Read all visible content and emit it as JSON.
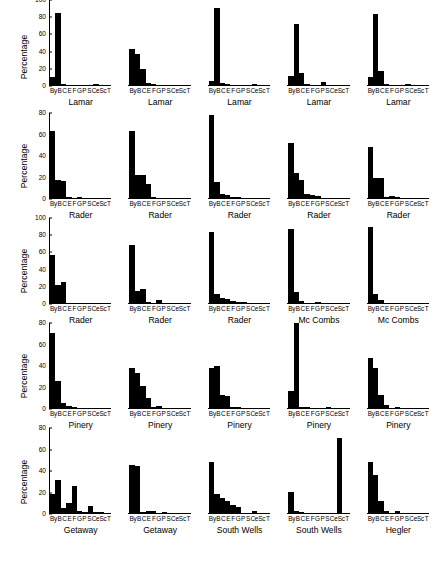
{
  "figure": {
    "y_axis_label": "Percentage",
    "x_categories": [
      "By",
      "B",
      "C",
      "E",
      "F",
      "G",
      "P",
      "S",
      "Ce",
      "Sc",
      "T"
    ],
    "x_tick_text": "ByB C E F G PSCeScT"
  },
  "chart_data": [
    {
      "type": "bar",
      "title": "Lamar",
      "ylabel": "Percentage",
      "xlabel": "",
      "ylim": [
        0,
        100
      ],
      "yticks": [
        0,
        20,
        40,
        60,
        80,
        100
      ],
      "grid": false,
      "categories": [
        "By",
        "B",
        "C",
        "E",
        "F",
        "G",
        "P",
        "S",
        "Ce",
        "Sc",
        "T"
      ],
      "values": [
        10,
        85,
        1,
        0,
        0,
        0,
        0,
        0,
        1,
        0,
        0
      ]
    },
    {
      "type": "bar",
      "title": "Lamar",
      "ylabel": "Percentage",
      "xlabel": "",
      "ylim": [
        0,
        100
      ],
      "yticks": [
        0,
        20,
        40,
        60,
        80,
        100
      ],
      "grid": false,
      "categories": [
        "By",
        "B",
        "C",
        "E",
        "F",
        "G",
        "P",
        "S",
        "Ce",
        "Sc",
        "T"
      ],
      "values": [
        42,
        37,
        19,
        2,
        1,
        0,
        0,
        0,
        0,
        0,
        0
      ]
    },
    {
      "type": "bar",
      "title": "Lamar",
      "ylabel": "Percentage",
      "xlabel": "",
      "ylim": [
        0,
        100
      ],
      "yticks": [
        0,
        20,
        40,
        60,
        80,
        100
      ],
      "grid": false,
      "categories": [
        "By",
        "B",
        "C",
        "E",
        "F",
        "G",
        "P",
        "S",
        "Ce",
        "Sc",
        "T"
      ],
      "values": [
        5,
        91,
        2,
        1,
        0,
        0,
        0,
        0,
        1,
        0,
        0
      ]
    },
    {
      "type": "bar",
      "title": "Lamar",
      "ylabel": "Percentage",
      "xlabel": "",
      "ylim": [
        0,
        100
      ],
      "yticks": [
        0,
        20,
        40,
        60,
        80,
        100
      ],
      "grid": false,
      "categories": [
        "By",
        "B",
        "C",
        "E",
        "F",
        "G",
        "P",
        "S",
        "Ce",
        "Sc",
        "T"
      ],
      "values": [
        11,
        72,
        14,
        1,
        0,
        0,
        3,
        0,
        0,
        0,
        0
      ]
    },
    {
      "type": "bar",
      "title": "Lamar",
      "ylabel": "Percentage",
      "xlabel": "",
      "ylim": [
        0,
        100
      ],
      "yticks": [
        0,
        20,
        40,
        60,
        80,
        100
      ],
      "grid": false,
      "categories": [
        "By",
        "B",
        "C",
        "E",
        "F",
        "G",
        "P",
        "S",
        "Ce",
        "Sc",
        "T"
      ],
      "values": [
        9,
        84,
        17,
        1,
        0,
        0,
        0,
        1,
        0,
        0,
        0
      ]
    },
    {
      "type": "bar",
      "title": "Rader",
      "ylabel": "Percentage",
      "xlabel": "",
      "ylim": [
        0,
        80
      ],
      "yticks": [
        0,
        20,
        40,
        60,
        80
      ],
      "grid": false,
      "categories": [
        "By",
        "B",
        "C",
        "E",
        "F",
        "G",
        "P",
        "S",
        "Ce",
        "Sc",
        "T"
      ],
      "values": [
        63,
        17,
        16,
        1,
        0,
        1,
        0,
        0,
        0,
        0,
        0
      ]
    },
    {
      "type": "bar",
      "title": "Rader",
      "ylabel": "Percentage",
      "xlabel": "",
      "ylim": [
        0,
        80
      ],
      "yticks": [
        0,
        20,
        40,
        60,
        80
      ],
      "grid": false,
      "categories": [
        "By",
        "B",
        "C",
        "E",
        "F",
        "G",
        "P",
        "S",
        "Ce",
        "Sc",
        "T"
      ],
      "values": [
        63,
        22,
        22,
        13,
        1,
        0,
        0,
        0,
        0,
        0,
        0
      ]
    },
    {
      "type": "bar",
      "title": "Rader",
      "ylabel": "Percentage",
      "xlabel": "",
      "ylim": [
        0,
        80
      ],
      "yticks": [
        0,
        20,
        40,
        60,
        80
      ],
      "grid": false,
      "categories": [
        "By",
        "B",
        "C",
        "E",
        "F",
        "G",
        "P",
        "S",
        "Ce",
        "Sc",
        "T"
      ],
      "values": [
        78,
        15,
        4,
        3,
        1,
        1,
        0,
        0,
        0,
        0,
        0
      ]
    },
    {
      "type": "bar",
      "title": "Rader",
      "ylabel": "Percentage",
      "xlabel": "",
      "ylim": [
        0,
        80
      ],
      "yticks": [
        0,
        20,
        40,
        60,
        80
      ],
      "grid": false,
      "categories": [
        "By",
        "B",
        "C",
        "E",
        "F",
        "G",
        "P",
        "S",
        "Ce",
        "Sc",
        "T"
      ],
      "values": [
        52,
        24,
        17,
        4,
        3,
        2,
        0,
        0,
        0,
        0,
        0
      ]
    },
    {
      "type": "bar",
      "title": "Rader",
      "ylabel": "Percentage",
      "xlabel": "",
      "ylim": [
        0,
        80
      ],
      "yticks": [
        0,
        20,
        40,
        60,
        80
      ],
      "grid": false,
      "categories": [
        "By",
        "B",
        "C",
        "E",
        "F",
        "G",
        "P",
        "S",
        "Ce",
        "Sc",
        "T"
      ],
      "values": [
        48,
        19,
        19,
        1,
        2,
        1,
        0,
        0,
        0,
        0,
        0
      ]
    },
    {
      "type": "bar",
      "title": "Rader",
      "ylabel": "Percentage",
      "xlabel": "",
      "ylim": [
        0,
        100
      ],
      "yticks": [
        0,
        20,
        40,
        60,
        80,
        100
      ],
      "grid": false,
      "categories": [
        "By",
        "B",
        "C",
        "E",
        "F",
        "G",
        "P",
        "S",
        "Ce",
        "Sc",
        "T"
      ],
      "values": [
        56,
        21,
        25,
        0,
        0,
        0,
        0,
        0,
        0,
        0,
        0
      ]
    },
    {
      "type": "bar",
      "title": "Rader",
      "ylabel": "Percentage",
      "xlabel": "",
      "ylim": [
        0,
        100
      ],
      "yticks": [
        0,
        20,
        40,
        60,
        80,
        100
      ],
      "grid": false,
      "categories": [
        "By",
        "B",
        "C",
        "E",
        "F",
        "G",
        "P",
        "S",
        "Ce",
        "Sc",
        "T"
      ],
      "values": [
        68,
        14,
        17,
        1,
        0,
        3,
        0,
        0,
        0,
        0,
        0
      ]
    },
    {
      "type": "bar",
      "title": "Rader",
      "ylabel": "Percentage",
      "xlabel": "",
      "ylim": [
        0,
        100
      ],
      "yticks": [
        0,
        20,
        40,
        60,
        80,
        100
      ],
      "grid": false,
      "categories": [
        "By",
        "B",
        "C",
        "E",
        "F",
        "G",
        "P",
        "S",
        "Ce",
        "Sc",
        "T"
      ],
      "values": [
        83,
        11,
        6,
        5,
        2,
        1,
        1,
        0,
        0,
        0,
        0
      ]
    },
    {
      "type": "bar",
      "title": "Mc Combs",
      "ylabel": "Percentage",
      "xlabel": "",
      "ylim": [
        0,
        100
      ],
      "yticks": [
        0,
        20,
        40,
        60,
        80,
        100
      ],
      "grid": false,
      "categories": [
        "By",
        "B",
        "C",
        "E",
        "F",
        "G",
        "P",
        "S",
        "Ce",
        "Sc",
        "T"
      ],
      "values": [
        87,
        13,
        2,
        0,
        0,
        1,
        0,
        0,
        0,
        0,
        0
      ]
    },
    {
      "type": "bar",
      "title": "Mc Combs",
      "ylabel": "Percentage",
      "xlabel": "",
      "ylim": [
        0,
        100
      ],
      "yticks": [
        0,
        20,
        40,
        60,
        80,
        100
      ],
      "grid": false,
      "categories": [
        "By",
        "B",
        "C",
        "E",
        "F",
        "G",
        "P",
        "S",
        "Ce",
        "Sc",
        "T"
      ],
      "values": [
        89,
        11,
        3,
        0,
        0,
        0,
        0,
        0,
        0,
        0,
        0
      ]
    },
    {
      "type": "bar",
      "title": "Pinery",
      "ylabel": "Percentage",
      "xlabel": "",
      "ylim": [
        0,
        80
      ],
      "yticks": [
        0,
        20,
        40,
        60,
        80
      ],
      "grid": false,
      "categories": [
        "By",
        "B",
        "C",
        "E",
        "F",
        "G",
        "P",
        "S",
        "Ce",
        "Sc",
        "T"
      ],
      "values": [
        71,
        25,
        5,
        2,
        1,
        0,
        0,
        0,
        0,
        0,
        0
      ]
    },
    {
      "type": "bar",
      "title": "Pinery",
      "ylabel": "Percentage",
      "xlabel": "",
      "ylim": [
        0,
        80
      ],
      "yticks": [
        0,
        20,
        40,
        60,
        80
      ],
      "grid": false,
      "categories": [
        "By",
        "B",
        "C",
        "E",
        "F",
        "G",
        "P",
        "S",
        "Ce",
        "Sc",
        "T"
      ],
      "values": [
        38,
        33,
        21,
        9,
        1,
        2,
        0,
        0,
        0,
        0,
        0
      ]
    },
    {
      "type": "bar",
      "title": "Pinery",
      "ylabel": "Percentage",
      "xlabel": "",
      "ylim": [
        0,
        80
      ],
      "yticks": [
        0,
        20,
        40,
        60,
        80
      ],
      "grid": false,
      "categories": [
        "By",
        "B",
        "C",
        "E",
        "F",
        "G",
        "P",
        "S",
        "Ce",
        "Sc",
        "T"
      ],
      "values": [
        38,
        40,
        12,
        11,
        1,
        1,
        0,
        0,
        0,
        0,
        0
      ]
    },
    {
      "type": "bar",
      "title": "Pinery",
      "ylabel": "Percentage",
      "xlabel": "",
      "ylim": [
        0,
        80
      ],
      "yticks": [
        0,
        20,
        40,
        60,
        80
      ],
      "grid": false,
      "categories": [
        "By",
        "B",
        "C",
        "E",
        "F",
        "G",
        "P",
        "S",
        "Ce",
        "Sc",
        "T"
      ],
      "values": [
        16,
        80,
        1,
        1,
        0,
        0,
        0,
        1,
        0,
        0,
        0
      ]
    },
    {
      "type": "bar",
      "title": "Pinery",
      "ylabel": "Percentage",
      "xlabel": "",
      "ylim": [
        0,
        80
      ],
      "yticks": [
        0,
        20,
        40,
        60,
        80
      ],
      "grid": false,
      "categories": [
        "By",
        "B",
        "C",
        "E",
        "F",
        "G",
        "P",
        "S",
        "Ce",
        "Sc",
        "T"
      ],
      "values": [
        47,
        38,
        12,
        3,
        0,
        1,
        0,
        0,
        0,
        0,
        0
      ]
    },
    {
      "type": "bar",
      "title": "Getaway",
      "ylabel": "Percentage",
      "xlabel": "",
      "ylim": [
        0,
        80
      ],
      "yticks": [
        0,
        20,
        40,
        60,
        80
      ],
      "grid": false,
      "categories": [
        "By",
        "B",
        "C",
        "E",
        "F",
        "G",
        "P",
        "S",
        "Ce",
        "Sc",
        "T"
      ],
      "values": [
        18,
        31,
        5,
        9,
        25,
        2,
        1,
        7,
        1,
        1,
        0
      ]
    },
    {
      "type": "bar",
      "title": "Getaway",
      "ylabel": "Percentage",
      "xlabel": "",
      "ylim": [
        0,
        80
      ],
      "yticks": [
        0,
        20,
        40,
        60,
        80
      ],
      "grid": false,
      "categories": [
        "By",
        "B",
        "C",
        "E",
        "F",
        "G",
        "P",
        "S",
        "Ce",
        "Sc",
        "T"
      ],
      "values": [
        45,
        44,
        1,
        2,
        2,
        0,
        1,
        0,
        0,
        0,
        0
      ]
    },
    {
      "type": "bar",
      "title": "South Wells",
      "ylabel": "Percentage",
      "xlabel": "",
      "ylim": [
        0,
        80
      ],
      "yticks": [
        0,
        20,
        40,
        60,
        80
      ],
      "grid": false,
      "categories": [
        "By",
        "B",
        "C",
        "E",
        "F",
        "G",
        "P",
        "S",
        "Ce",
        "Sc",
        "T"
      ],
      "values": [
        48,
        18,
        14,
        11,
        8,
        6,
        0,
        0,
        2,
        0,
        0
      ]
    },
    {
      "type": "bar",
      "title": "South Wells",
      "ylabel": "Percentage",
      "xlabel": "",
      "ylim": [
        0,
        80
      ],
      "yticks": [
        0,
        20,
        40,
        60,
        80
      ],
      "grid": false,
      "categories": [
        "By",
        "B",
        "C",
        "E",
        "F",
        "G",
        "P",
        "S",
        "Ce",
        "Sc",
        "T"
      ],
      "values": [
        20,
        2,
        1,
        0,
        0,
        0,
        0,
        0,
        0,
        71,
        0
      ]
    },
    {
      "type": "bar",
      "title": "Hegler",
      "ylabel": "Percentage",
      "xlabel": "",
      "ylim": [
        0,
        80
      ],
      "yticks": [
        0,
        20,
        40,
        60,
        80
      ],
      "grid": false,
      "categories": [
        "By",
        "B",
        "C",
        "E",
        "F",
        "G",
        "P",
        "S",
        "Ce",
        "Sc",
        "T"
      ],
      "values": [
        48,
        36,
        11,
        2,
        0,
        2,
        0,
        0,
        0,
        0,
        0
      ]
    }
  ]
}
